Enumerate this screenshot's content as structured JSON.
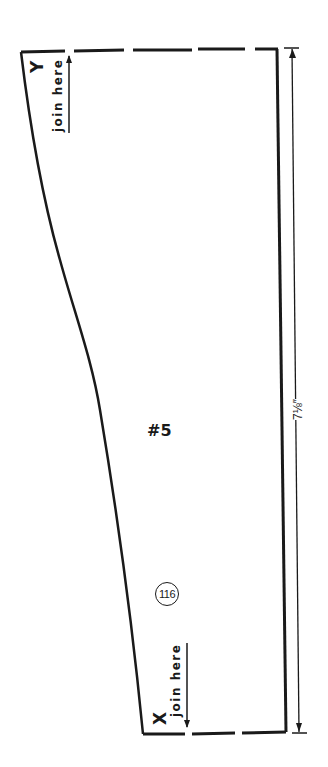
{
  "pattern": {
    "piece_label": "#5",
    "piece_number": "116",
    "top_marker": {
      "letter": "Y",
      "text": "join here"
    },
    "bottom_marker": {
      "letter": "X",
      "text": "join here"
    },
    "dimension": "7⅛″",
    "line_color": "#1a1a1a",
    "background": "#ffffff"
  }
}
